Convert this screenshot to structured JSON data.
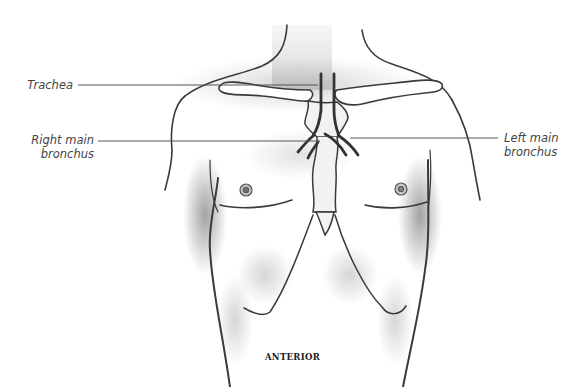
{
  "figure": {
    "view": "ANTERIOR",
    "colors": {
      "background": "#ffffff",
      "outline": "#3a3a3a",
      "shading": "#9a9a9a",
      "leader_line": "#555555",
      "label_text": "#444444"
    }
  },
  "labels": {
    "trachea": "Trachea",
    "right_main_bronchus_line1": "Right main",
    "right_main_bronchus_line2": "bronchus",
    "left_main_bronchus_line1": "Left main",
    "left_main_bronchus_line2": "bronchus"
  },
  "caption": "ANTERIOR"
}
